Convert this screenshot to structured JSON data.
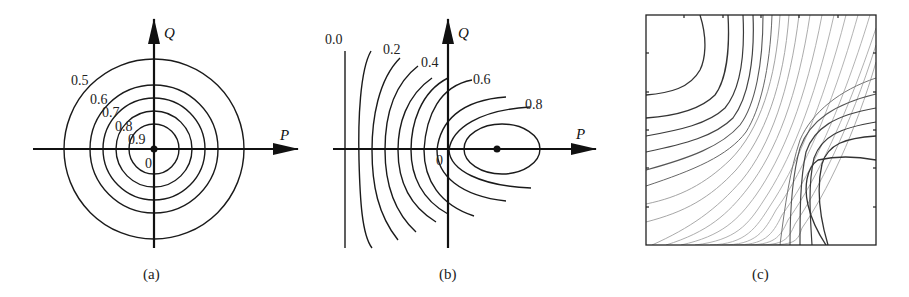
{
  "figure": {
    "panels": [
      {
        "id": "a",
        "caption": "(a)",
        "axes": {
          "x_label": "P",
          "y_label": "Q",
          "origin_label": "0"
        },
        "contour_labels": [
          "0.5",
          "0.6",
          "0.7",
          "0.8",
          "0.9"
        ],
        "description": "Concentric circular contours centered at origin"
      },
      {
        "id": "b",
        "caption": "(b)",
        "axes": {
          "x_label": "P",
          "y_label": "Q",
          "origin_label": "0"
        },
        "contour_labels": [
          "0.0",
          "0.2",
          "0.4",
          "0.6",
          "0.8"
        ],
        "description": "Contours shifted toward positive P, closing into an ellipse around a point on the P axis"
      },
      {
        "id": "c",
        "caption": "(c)",
        "description": "Saddle-shaped contour plot in a square frame"
      }
    ]
  },
  "colors": {
    "line": "#1a1a1a",
    "light_line": "#8a8a8a",
    "background": "#ffffff"
  }
}
